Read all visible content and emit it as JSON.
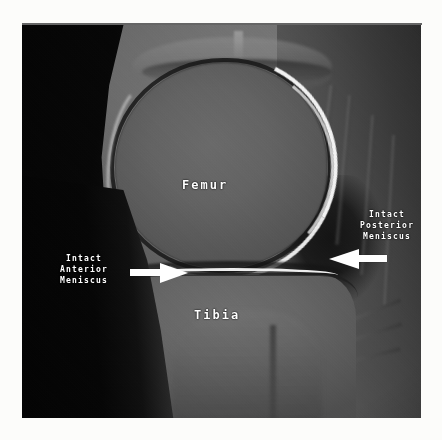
{
  "page": {
    "background_color": "#fcfcfa",
    "ghost_text": [
      "horizontal rule artifact from scanned page",
      "faint offset print bleed-through"
    ]
  },
  "image": {
    "kind": "mri-scan",
    "modality": "MRI",
    "region": "knee",
    "plane": "sagittal",
    "panel_background_color": "#1a1a1a",
    "caption": ""
  },
  "annotations": {
    "femur": {
      "label": "Femur",
      "color": "#ffffff",
      "x": 160,
      "y": 153
    },
    "tibia": {
      "label": "Tibia",
      "color": "#ffffff",
      "x": 172,
      "y": 283
    },
    "anterior_meniscus": {
      "line1": "Intact",
      "line2": "Anterior",
      "line3": "Meniscus",
      "color": "#ffffff",
      "arrow_direction": "right",
      "x": 38,
      "y": 228
    },
    "posterior_meniscus": {
      "line1": "Intact",
      "line2": "Posterior",
      "line3": "Meniscus",
      "color": "#ffffff",
      "arrow_direction": "left",
      "x": 338,
      "y": 184
    }
  },
  "icons": {
    "arrow_right": "arrow-right-icon",
    "arrow_left": "arrow-left-icon"
  }
}
